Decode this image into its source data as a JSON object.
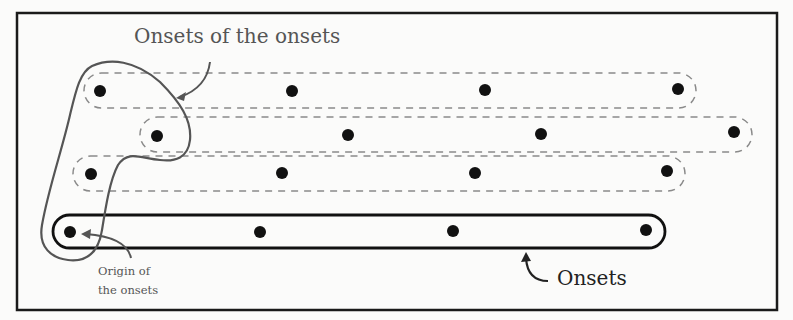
{
  "figure": {
    "labels": {
      "onsets_of_onsets": "Onsets of the onsets",
      "onsets": "Onsets",
      "origin_line1": "Origin of",
      "origin_line2": "the onsets"
    },
    "colors": {
      "frame": "#1a1a1a",
      "dot": "#111111",
      "dashed_capsule": "#888888",
      "solid_capsule": "#111111",
      "grouping_outline": "#555555",
      "arrow": "#555555"
    },
    "rows": [
      {
        "name": "row-1",
        "style": "dashed",
        "y": 91,
        "dots_x": [
          100,
          292,
          485,
          678
        ]
      },
      {
        "name": "row-2",
        "style": "dashed",
        "y": 134,
        "dots_x": [
          157,
          348,
          541,
          734
        ]
      },
      {
        "name": "row-3",
        "style": "dashed",
        "y": 173,
        "dots_x": [
          91,
          282,
          475,
          667
        ]
      },
      {
        "name": "row-4",
        "style": "solid",
        "y": 231,
        "dots_x": [
          70,
          260,
          453,
          646
        ]
      }
    ]
  }
}
